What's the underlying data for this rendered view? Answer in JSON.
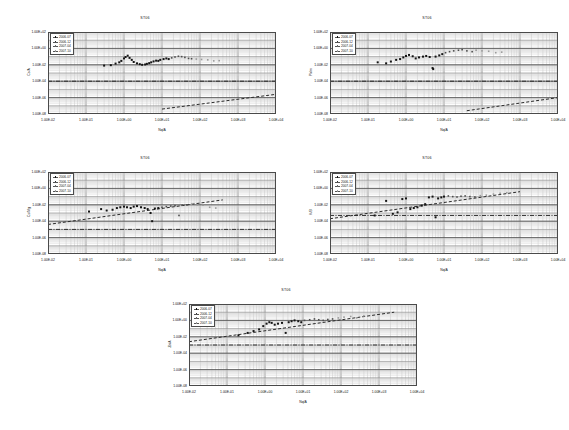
{
  "page": {
    "background": "#ffffff",
    "layout": "five log-log scatter charts, two rows of two plus one centered bottom"
  },
  "axes_common": {
    "xlabel": "Nq/A",
    "xticks": [
      "1.00E-02",
      "1.00E-01",
      "1.00E+00",
      "1.00E+01",
      "1.00E+02",
      "1.00E+03",
      "1.00E+04"
    ],
    "yticks": [
      "1.00E+02",
      "1.00E+00",
      "1.00E-02",
      "1.00E-04",
      "1.00E-06",
      "1.00E-08"
    ],
    "xlim_exp": [
      -2,
      4
    ],
    "ylim_exp": [
      -8,
      2
    ],
    "xscale": "log",
    "yscale": "log",
    "grid": "major and minor log grid"
  },
  "legend_common": {
    "entries": [
      {
        "label": "2006-07",
        "marker": "filled-diamond",
        "color": "#141414"
      },
      {
        "label": "2006-12",
        "marker": "filled-square",
        "color": "#333333"
      },
      {
        "label": "2007-04",
        "marker": "open-triangle",
        "color": "#6a6a6a"
      },
      {
        "label": "2007-10",
        "marker": "cross",
        "color": "#9a9a9a"
      }
    ]
  },
  "charts": [
    {
      "id": "chart-1",
      "title": "ST06",
      "ylabel": "Cs/A",
      "hline_exp": -4,
      "trend": {
        "x0_exp": 1.0,
        "y0_exp": -7.4,
        "x1_exp": 4.0,
        "y1_exp": -5.6
      },
      "chart_data": {
        "type": "scatter",
        "title": "ST06",
        "xlabel": "Nq/A",
        "ylabel": "Cs/A",
        "xscale": "log",
        "yscale": "log",
        "xlim": [
          0.01,
          10000
        ],
        "ylim": [
          1e-08,
          100
        ],
        "grid": true,
        "legend_position": "top-left inside plot",
        "reference_line": {
          "type": "horizontal-dashdot",
          "y": 0.0001
        },
        "trend_line": {
          "type": "dashed",
          "from": [
            10,
            4e-08
          ],
          "to": [
            10000,
            2.5e-06
          ]
        },
        "series": [
          {
            "name": "2006-07",
            "points": [
              [
                0.3,
                0.008
              ],
              [
                0.45,
                0.009
              ],
              [
                0.6,
                0.014
              ],
              [
                0.75,
                0.02
              ],
              [
                0.85,
                0.03
              ],
              [
                1.0,
                0.06
              ],
              [
                1.1,
                0.09
              ],
              [
                1.25,
                0.13
              ],
              [
                1.4,
                0.07
              ],
              [
                1.6,
                0.04
              ],
              [
                1.8,
                0.022
              ],
              [
                2.2,
                0.015
              ],
              [
                2.6,
                0.012
              ],
              [
                3.0,
                0.01
              ],
              [
                3.6,
                0.011
              ]
            ]
          },
          {
            "name": "2006-12",
            "points": [
              [
                4.0,
                0.013
              ],
              [
                4.6,
                0.016
              ],
              [
                5.2,
                0.02
              ],
              [
                6.0,
                0.026
              ],
              [
                7.0,
                0.032
              ],
              [
                8.0,
                0.03
              ],
              [
                9.0,
                0.04
              ],
              [
                11,
                0.05
              ],
              [
                13,
                0.06
              ],
              [
                15,
                0.05
              ]
            ]
          },
          {
            "name": "2007-04",
            "points": [
              [
                18,
                0.07
              ],
              [
                22,
                0.09
              ],
              [
                27,
                0.11
              ],
              [
                33,
                0.1
              ],
              [
                40,
                0.08
              ],
              [
                50,
                0.06
              ],
              [
                60,
                0.055
              ]
            ]
          },
          {
            "name": "2007-10",
            "points": [
              [
                80,
                0.05
              ],
              [
                110,
                0.045
              ],
              [
                160,
                0.04
              ],
              [
                230,
                0.03
              ],
              [
                320,
                0.032
              ]
            ]
          }
        ]
      }
    },
    {
      "id": "chart-2",
      "title": "ST06",
      "ylabel": "Pk/m",
      "hline_exp": -4,
      "trend": {
        "x0_exp": 1.6,
        "y0_exp": -7.6,
        "x1_exp": 4.0,
        "y1_exp": -6.0
      },
      "chart_data": {
        "type": "scatter",
        "title": "ST06",
        "xlabel": "Nq/A",
        "ylabel": "Pk/m",
        "xscale": "log",
        "yscale": "log",
        "xlim": [
          0.01,
          10000
        ],
        "ylim": [
          1e-08,
          100
        ],
        "grid": true,
        "legend_position": "top-left inside plot",
        "reference_line": {
          "type": "horizontal-dashdot",
          "y": 0.0001
        },
        "trend_line": {
          "type": "dashed",
          "from": [
            40,
            2.5e-08
          ],
          "to": [
            10000,
            1e-06
          ]
        },
        "series": [
          {
            "name": "2006-07",
            "points": [
              [
                0.18,
                0.02
              ],
              [
                0.3,
                0.015
              ],
              [
                0.4,
                0.025
              ],
              [
                0.55,
                0.04
              ],
              [
                0.7,
                0.05
              ],
              [
                0.85,
                0.08
              ],
              [
                1.0,
                0.12
              ],
              [
                1.2,
                0.16
              ],
              [
                1.5,
                0.11
              ],
              [
                1.8,
                0.06
              ]
            ]
          },
          {
            "name": "2006-12",
            "points": [
              [
                2.2,
                0.08
              ],
              [
                2.8,
                0.1
              ],
              [
                3.4,
                0.12
              ],
              [
                4.2,
                0.09
              ],
              [
                5.0,
                0.004
              ],
              [
                5.2,
                0.003
              ],
              [
                6.0,
                0.1
              ],
              [
                7.5,
                0.14
              ],
              [
                9.0,
                0.2
              ]
            ]
          },
          {
            "name": "2007-04",
            "points": [
              [
                11,
                0.3
              ],
              [
                14,
                0.4
              ],
              [
                18,
                0.5
              ],
              [
                24,
                0.6
              ],
              [
                30,
                0.7
              ],
              [
                40,
                0.5
              ],
              [
                55,
                0.4
              ]
            ]
          },
          {
            "name": "2007-10",
            "points": [
              [
                70,
                0.6
              ],
              [
                100,
                0.5
              ],
              [
                150,
                0.45
              ],
              [
                230,
                0.3
              ],
              [
                330,
                0.35
              ]
            ]
          }
        ]
      }
    },
    {
      "id": "chart-3",
      "title": "ST06",
      "ylabel": "Cs/Mg",
      "hline_exp": -5,
      "trend": {
        "x0_exp": -2.0,
        "y0_exp": -4.4,
        "x1_exp": 2.6,
        "y1_exp": -1.4
      },
      "chart_data": {
        "type": "scatter",
        "title": "ST06",
        "xlabel": "Nq/A",
        "ylabel": "Cs/Mg",
        "xscale": "log",
        "yscale": "log",
        "xlim": [
          0.01,
          10000
        ],
        "ylim": [
          1e-08,
          100
        ],
        "grid": true,
        "legend_position": "top-left inside plot",
        "reference_line": {
          "type": "horizontal-dashdot",
          "y": 1e-05
        },
        "trend_line": {
          "type": "dashed",
          "from": [
            0.01,
            4e-05
          ],
          "to": [
            400,
            0.04
          ]
        },
        "series": [
          {
            "name": "2006-07",
            "points": [
              [
                0.12,
                0.0015
              ],
              [
                0.25,
                0.003
              ],
              [
                0.35,
                0.002
              ],
              [
                0.5,
                0.0025
              ],
              [
                0.65,
                0.004
              ],
              [
                0.8,
                0.005
              ],
              [
                1.0,
                0.006
              ],
              [
                1.2,
                0.005
              ],
              [
                1.5,
                0.004
              ]
            ]
          },
          {
            "name": "2006-12",
            "points": [
              [
                1.8,
                0.006
              ],
              [
                2.2,
                0.007
              ],
              [
                2.8,
                0.005
              ],
              [
                3.5,
                0.004
              ],
              [
                4.2,
                0.003
              ],
              [
                5.0,
                0.001
              ],
              [
                5.5,
                0.0001
              ],
              [
                6.5,
                0.0035
              ],
              [
                8.0,
                0.004
              ]
            ]
          },
          {
            "name": "2007-04",
            "points": [
              [
                10,
                0.005
              ],
              [
                13,
                0.006
              ],
              [
                17,
                0.007
              ],
              [
                22,
                0.008
              ],
              [
                28,
                0.0005
              ],
              [
                34,
                0.009
              ],
              [
                45,
                0.01
              ]
            ]
          },
          {
            "name": "2007-10",
            "points": [
              [
                60,
                0.012
              ],
              [
                85,
                0.01
              ],
              [
                120,
                0.009
              ],
              [
                180,
                0.005
              ],
              [
                260,
                0.004
              ]
            ]
          }
        ]
      }
    },
    {
      "id": "chart-4",
      "title": "ST06",
      "ylabel": "K/B",
      "hline_exp": -3.3,
      "trend": {
        "x0_exp": -2.0,
        "y0_exp": -3.7,
        "x1_exp": 3.0,
        "y1_exp": -0.4
      },
      "chart_data": {
        "type": "scatter",
        "title": "ST06",
        "xlabel": "Nq/A",
        "ylabel": "K/B",
        "xscale": "log",
        "yscale": "log",
        "xlim": [
          0.01,
          10000
        ],
        "ylim": [
          1e-08,
          100
        ],
        "grid": true,
        "legend_position": "top-left inside plot",
        "reference_line": {
          "type": "horizontal-dashdot",
          "y": 0.0005
        },
        "trend_line": {
          "type": "dashed",
          "from": [
            0.01,
            0.0002
          ],
          "to": [
            1000,
            0.4
          ]
        },
        "series": [
          {
            "name": "2006-07",
            "points": [
              [
                0.15,
                0.0005
              ],
              [
                0.3,
                0.03
              ],
              [
                0.45,
                0.0008
              ],
              [
                0.6,
                0.0012
              ],
              [
                0.8,
                0.05
              ],
              [
                1.0,
                0.06
              ],
              [
                1.3,
                0.003
              ],
              [
                1.6,
                0.004
              ],
              [
                2.0,
                0.005
              ]
            ]
          },
          {
            "name": "2006-12",
            "points": [
              [
                2.6,
                0.008
              ],
              [
                3.2,
                0.012
              ],
              [
                4.0,
                0.08
              ],
              [
                5.0,
                0.1
              ],
              [
                6.0,
                0.0003
              ],
              [
                7.0,
                0.06
              ],
              [
                8.5,
                0.08
              ],
              [
                10,
                0.1
              ]
            ]
          },
          {
            "name": "2007-04",
            "points": [
              [
                13,
                0.12
              ],
              [
                17,
                0.1
              ],
              [
                22,
                0.09
              ],
              [
                28,
                0.11
              ],
              [
                36,
                0.12
              ],
              [
                48,
                0.1
              ],
              [
                65,
                0.09
              ]
            ]
          },
          {
            "name": "2007-10",
            "points": [
              [
                90,
                0.13
              ],
              [
                130,
                0.15
              ],
              [
                200,
                0.2
              ],
              [
                300,
                0.25
              ],
              [
                450,
                0.3
              ]
            ]
          }
        ]
      }
    },
    {
      "id": "chart-5",
      "title": "ST06",
      "ylabel": "Zn/A",
      "hline_exp": -3.0,
      "trend": {
        "x0_exp": -2.0,
        "y0_exp": -2.6,
        "x1_exp": 3.4,
        "y1_exp": 1.0
      },
      "chart_data": {
        "type": "scatter",
        "title": "ST06",
        "xlabel": "Nq/A",
        "ylabel": "Zn/A",
        "xscale": "log",
        "yscale": "log",
        "xlim": [
          0.01,
          10000
        ],
        "ylim": [
          1e-08,
          100
        ],
        "grid": true,
        "legend_position": "top-left inside plot",
        "reference_line": {
          "type": "horizontal-dashdot",
          "y": 0.001
        },
        "trend_line": {
          "type": "dashed",
          "from": [
            0.01,
            0.0025
          ],
          "to": [
            2500,
            10.0
          ]
        },
        "series": [
          {
            "name": "2006-07",
            "points": [
              [
                0.2,
                0.015
              ],
              [
                0.35,
                0.03
              ],
              [
                0.5,
                0.05
              ],
              [
                0.7,
                0.08
              ],
              [
                0.9,
                0.2
              ],
              [
                1.1,
                0.4
              ],
              [
                1.3,
                0.6
              ],
              [
                1.5,
                0.5
              ],
              [
                1.8,
                0.3
              ]
            ]
          },
          {
            "name": "2006-12",
            "points": [
              [
                2.2,
                0.4
              ],
              [
                2.8,
                0.5
              ],
              [
                3.5,
                0.03
              ],
              [
                4.2,
                0.6
              ],
              [
                5.0,
                0.8
              ],
              [
                6.0,
                1.0
              ],
              [
                7.5,
                0.8
              ],
              [
                9.0,
                0.6
              ]
            ]
          },
          {
            "name": "2007-04",
            "points": [
              [
                11,
                1.0
              ],
              [
                15,
                1.2
              ],
              [
                20,
                1.5
              ],
              [
                26,
                1.2
              ],
              [
                34,
                1.0
              ],
              [
                45,
                1.3
              ],
              [
                60,
                1.5
              ]
            ]
          },
          {
            "name": "2007-10",
            "points": [
              [
                85,
                2.0
              ],
              [
                120,
                2.5
              ],
              [
                180,
                3.0
              ],
              [
                260,
                2.0
              ],
              [
                400,
                3.5
              ]
            ]
          }
        ]
      }
    }
  ]
}
